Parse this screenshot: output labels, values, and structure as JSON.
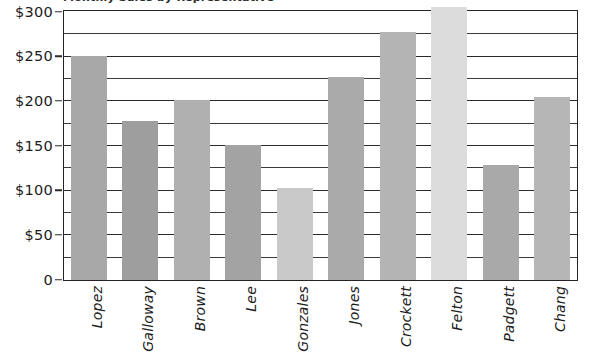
{
  "chart_data": {
    "type": "bar",
    "title": "Monthly Sales by Representative",
    "xlabel": "",
    "ylabel": "",
    "ylim": [
      0,
      300
    ],
    "y_major_step": 50,
    "y_minor_step": 25,
    "grid": true,
    "legend": "none",
    "y_tick_labels": [
      "$300",
      "$250",
      "$200",
      "$150",
      "$100",
      "$50",
      "0"
    ],
    "y_tick_values": [
      300,
      250,
      200,
      150,
      100,
      50,
      0
    ],
    "categories": [
      "Lopez",
      "Galloway",
      "Brown",
      "Lee",
      "Gonzales",
      "Jones",
      "Crockett",
      "Felton",
      "Padgett",
      "Chang"
    ],
    "values": [
      250,
      177,
      201,
      151,
      102,
      227,
      277,
      305,
      128,
      204
    ],
    "bar_colors": [
      "#a8a8a8",
      "#9e9e9e",
      "#b0b0b0",
      "#a3a3a3",
      "#c9c9c9",
      "#aaaaaa",
      "#b4b4b4",
      "#dcdcdc",
      "#a9a9a9",
      "#b6b6b6"
    ],
    "axis_color": "#232323",
    "grid_color": "#3a3a3a",
    "text_color": "#1c1c1c",
    "background": "#ffffff"
  }
}
